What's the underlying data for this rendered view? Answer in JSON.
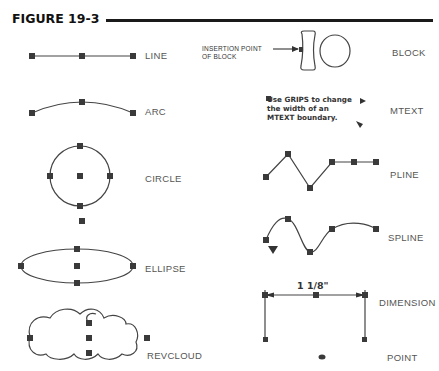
{
  "figure": {
    "title": "FIGURE 19-3"
  },
  "labels": {
    "line": "LINE",
    "arc": "ARC",
    "circle": "CIRCLE",
    "ellipse": "ELLIPSE",
    "revcloud": "REVCLOUD",
    "block": "BLOCK",
    "mtext": "MTEXT",
    "pline": "PLINE",
    "spline": "SPLINE",
    "dimension": "DIMENSION",
    "point": "POINT"
  },
  "annotations": {
    "insertion_point_line1": "INSERTION POINT",
    "insertion_point_line2": "OF BLOCK",
    "mtext_line1": "Use GRIPS to change",
    "mtext_line2": "the width of an",
    "mtext_line3": "MTEXT boundary.",
    "dimension_value": "1 1/8\""
  },
  "colors": {
    "stroke": "#444444",
    "grip": "#3a3a3a",
    "rule": "#1a1a1a"
  }
}
